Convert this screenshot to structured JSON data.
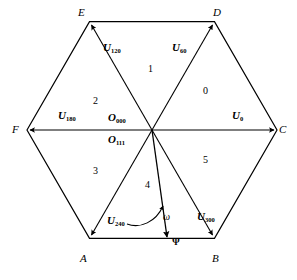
{
  "figure": {
    "type": "space-vector-hexagon",
    "background_color": "#ffffff",
    "line_color": "#000000"
  },
  "vertices": [
    {
      "name": "A",
      "label": "A",
      "position": "bottom-left"
    },
    {
      "name": "B",
      "label": "B",
      "position": "bottom-right"
    },
    {
      "name": "C",
      "label": "C",
      "position": "right"
    },
    {
      "name": "D",
      "label": "D",
      "position": "top-right"
    },
    {
      "name": "E",
      "label": "E",
      "position": "top-left"
    },
    {
      "name": "F",
      "label": "F",
      "position": "left"
    }
  ],
  "sectors": [
    {
      "label": "0",
      "angle_range": "0-60"
    },
    {
      "label": "1",
      "angle_range": "60-120"
    },
    {
      "label": "2",
      "angle_range": "120-180"
    },
    {
      "label": "3",
      "angle_range": "180-240"
    },
    {
      "label": "4",
      "angle_range": "240-300"
    },
    {
      "label": "5",
      "angle_range": "300-360"
    }
  ],
  "vectors": [
    {
      "name": "U0",
      "base": "U",
      "subscript": "0",
      "angle": 0,
      "target_vertex": "C"
    },
    {
      "name": "U60",
      "base": "U",
      "subscript": "60",
      "angle": 60,
      "target_vertex": "D"
    },
    {
      "name": "U120",
      "base": "U",
      "subscript": "120",
      "angle": 120,
      "target_vertex": "E"
    },
    {
      "name": "U180",
      "base": "U",
      "subscript": "180",
      "angle": 180,
      "target_vertex": "F"
    },
    {
      "name": "U240",
      "base": "U",
      "subscript": "240",
      "angle": 240,
      "target_vertex": "A"
    },
    {
      "name": "U300",
      "base": "U",
      "subscript": "300",
      "angle": 300,
      "target_vertex": "B"
    }
  ],
  "zero_vectors": [
    {
      "name": "O000",
      "base": "O",
      "subscript": "000"
    },
    {
      "name": "O111",
      "base": "O",
      "subscript": "111"
    }
  ],
  "annotations": {
    "flux_vector": "Ψ",
    "angular_velocity": "ω"
  }
}
